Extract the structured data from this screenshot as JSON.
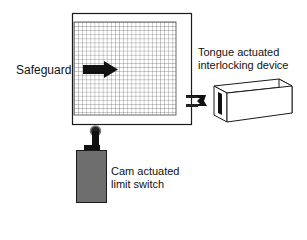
{
  "labels": {
    "safeguard": "Safeguard",
    "tongue_line1": "Tongue actuated",
    "tongue_line2": "interlocking device",
    "cam_line1": "Cam actuated",
    "cam_line2": "limit switch"
  },
  "colors": {
    "line": "#1a1a1a",
    "grid": "#555555",
    "switch_body": "#6e6e6e",
    "background": "#ffffff"
  }
}
